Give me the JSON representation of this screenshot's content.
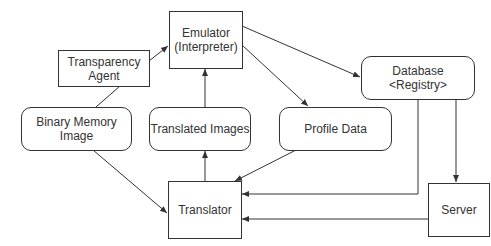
{
  "diagram": {
    "nodes": {
      "emulator": {
        "line1": "Emulator",
        "line2": "(Interpreter)",
        "shape": "rectangle"
      },
      "transparency_agent": {
        "line1": "Transparency",
        "line2": "Agent",
        "shape": "rectangle"
      },
      "binary_memory_image": {
        "label": "Binary Memory Image",
        "shape": "rounded-rectangle"
      },
      "translated_images": {
        "label": "Translated Images",
        "shape": "rounded-rectangle"
      },
      "profile_data": {
        "label": "Profile Data",
        "shape": "rounded-rectangle"
      },
      "database": {
        "line1": "Database",
        "line2": "<Registry>",
        "shape": "rounded-rectangle"
      },
      "translator": {
        "label": "Translator",
        "shape": "rectangle"
      },
      "server": {
        "label": "Server",
        "shape": "rectangle"
      }
    },
    "edges": [
      {
        "from": "Transparency Agent",
        "to": "Emulator (Interpreter)"
      },
      {
        "from": "Binary Memory Image",
        "to": "Transparency Agent",
        "arrow": false
      },
      {
        "from": "Translated Images",
        "to": "Emulator (Interpreter)"
      },
      {
        "from": "Emulator (Interpreter)",
        "to": "Database <Registry>"
      },
      {
        "from": "Emulator (Interpreter)",
        "to": "Profile Data"
      },
      {
        "from": "Binary Memory Image",
        "to": "Translator"
      },
      {
        "from": "Translator",
        "to": "Translated Images"
      },
      {
        "from": "Profile Data",
        "to": "Translator"
      },
      {
        "from": "Database <Registry>",
        "to": "Translator"
      },
      {
        "from": "Database <Registry>",
        "to": "Server"
      },
      {
        "from": "Server",
        "to": "Translator"
      }
    ],
    "colors": {
      "line": "#333333",
      "background": "#ffffff"
    }
  }
}
